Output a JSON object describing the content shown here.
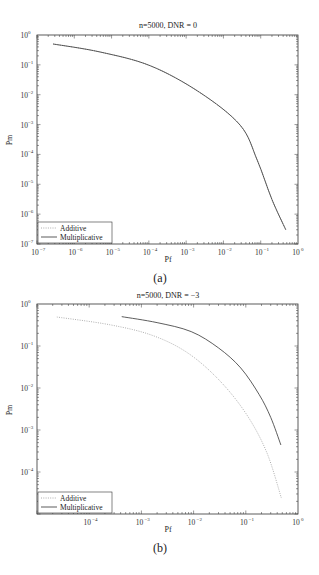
{
  "chart_data": [
    {
      "type": "line",
      "panel": "a",
      "caption": "(a)",
      "title": "n=5000, DNR = 0",
      "xlabel": "Pf",
      "ylabel": "Pm",
      "xscale": "log",
      "yscale": "log",
      "xlim": [
        1e-07,
        1
      ],
      "ylim": [
        1e-07,
        1
      ],
      "xticks": [
        -7,
        -6,
        -5,
        -4,
        -3,
        -2,
        -1,
        0
      ],
      "yticks": [
        0,
        -1,
        -2,
        -3,
        -4,
        -5,
        -6,
        -7
      ],
      "grid": false,
      "legend_position": "lower left",
      "series": [
        {
          "name": "Additive",
          "style": "dotted",
          "x": [
            2.7e-07,
            4.9e-06,
            0.00011,
            0.0023,
            0.028,
            0.08,
            0.2,
            0.47
          ],
          "y": [
            0.5,
            0.27,
            0.093,
            0.012,
            0.00096,
            6.6e-05,
            3.1e-06,
            3e-07
          ]
        },
        {
          "name": "Multiplicative",
          "style": "solid",
          "x": [
            2.7e-07,
            4.9e-06,
            0.00011,
            0.0023,
            0.028,
            0.08,
            0.2,
            0.47
          ],
          "y": [
            0.5,
            0.27,
            0.093,
            0.012,
            0.00096,
            6.6e-05,
            3.1e-06,
            3e-07
          ]
        }
      ]
    },
    {
      "type": "line",
      "panel": "b",
      "caption": "(b)",
      "title": "n=5000, DNR = −3",
      "xlabel": "Pf",
      "ylabel": "Pm",
      "xscale": "log",
      "yscale": "log",
      "xlim": [
        1e-05,
        1
      ],
      "ylim": [
        1e-05,
        1
      ],
      "xticks": [
        -4,
        -3,
        -2,
        -1,
        0
      ],
      "yticks": [
        0,
        -1,
        -2,
        -3,
        -4
      ],
      "grid": false,
      "legend_position": "lower left",
      "series": [
        {
          "name": "Additive",
          "style": "dotted",
          "x": [
            2.4e-05,
            0.00025,
            0.0016,
            0.0075,
            0.03,
            0.1,
            0.25,
            0.48
          ],
          "y": [
            0.49,
            0.32,
            0.18,
            0.07,
            0.016,
            0.0025,
            0.0003,
            2.4e-05
          ]
        },
        {
          "name": "Multiplicative",
          "style": "solid",
          "x": [
            0.00042,
            0.002,
            0.009,
            0.03,
            0.08,
            0.18,
            0.3,
            0.47
          ],
          "y": [
            0.5,
            0.36,
            0.22,
            0.09,
            0.03,
            0.007,
            0.002,
            0.00044
          ]
        }
      ]
    }
  ],
  "panels": [
    {
      "title": "n=5000, DNR = 0",
      "xlabel": "Pf",
      "ylabel": "Pm",
      "caption": "(a)",
      "legend": [
        "Additive",
        "Multiplicative"
      ]
    },
    {
      "title": "n=5000, DNR = −3",
      "xlabel": "Pf",
      "ylabel": "Pm",
      "caption": "(b)",
      "legend": [
        "Additive",
        "Multiplicative"
      ]
    }
  ]
}
